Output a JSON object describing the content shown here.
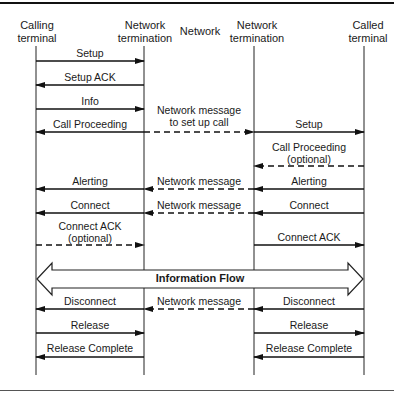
{
  "participants": [
    {
      "id": "calling",
      "line1": "Calling",
      "line2": "terminal"
    },
    {
      "id": "nt1",
      "line1": "Network",
      "line2": "termination"
    },
    {
      "id": "network",
      "line1": "Network",
      "line2": ""
    },
    {
      "id": "nt2",
      "line1": "Network",
      "line2": "termination"
    },
    {
      "id": "called",
      "line1": "Called",
      "line2": "terminal"
    }
  ],
  "messages": {
    "setup_1": "Setup",
    "setup_ack": "Setup ACK",
    "info": "Info",
    "call_proceeding_1": "Call Proceeding",
    "net_setup_line1": "Network message",
    "net_setup_line2": "to set up call",
    "setup_2": "Setup",
    "call_proceeding_2_line1": "Call Proceeding",
    "call_proceeding_2_line2": "(optional)",
    "alerting_1": "Alerting",
    "net_alerting": "Network message",
    "alerting_2": "Alerting",
    "connect_1": "Connect",
    "net_connect": "Network message",
    "connect_2": "Connect",
    "connect_ack_1_line1": "Connect ACK",
    "connect_ack_1_line2": "(optional)",
    "connect_ack_2": "Connect ACK",
    "information_flow": "Information Flow",
    "disconnect_1": "Disconnect",
    "net_disconnect": "Network message",
    "disconnect_2": "Disconnect",
    "release_1": "Release",
    "release_2": "Release",
    "release_complete_1": "Release Complete",
    "release_complete_2": "Release Complete"
  }
}
